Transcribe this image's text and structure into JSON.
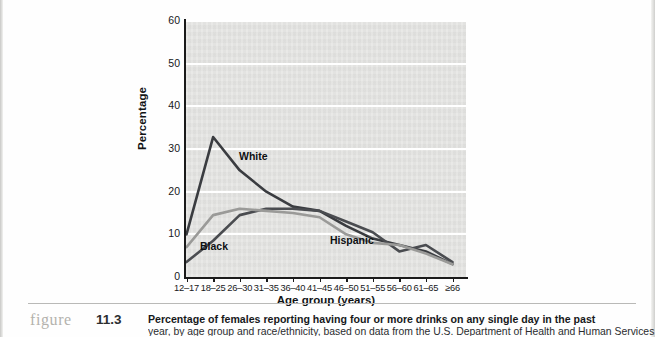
{
  "figure": {
    "label_word": "figure",
    "number": "11.3",
    "caption_line1": "Percentage of females reporting having four or more drinks on any single day in the past",
    "caption_line2": "year, by age group and race/ethnicity, based on data from the U.S. Department of Health and Human Services"
  },
  "chart_data": {
    "type": "line",
    "title": "",
    "xlabel": "Age group (years)",
    "ylabel": "Percentage",
    "categories": [
      "12–17",
      "18–25",
      "26–30",
      "31–35",
      "36–40",
      "41–45",
      "46–50",
      "51–55",
      "56–60",
      "61–65",
      "≥66"
    ],
    "ylim": [
      0,
      60
    ],
    "yticks": [
      0,
      10,
      20,
      30,
      40,
      50,
      60
    ],
    "grid": "horizontal",
    "legend": "inline-labels",
    "series": [
      {
        "name": "White",
        "color": "#3a3c40",
        "values": [
          10,
          32.8,
          25,
          20,
          16.5,
          15.5,
          12,
          9,
          7.5,
          6,
          3
        ]
      },
      {
        "name": "Black",
        "color": "#4a4c50",
        "values": [
          3.5,
          8.5,
          14.5,
          16,
          16,
          15.5,
          13,
          10.5,
          6,
          7.5,
          3.5
        ]
      },
      {
        "name": "Hispanic",
        "color": "#9a9a98",
        "values": [
          7,
          14.5,
          16,
          15.5,
          15,
          14,
          10,
          8,
          7.5,
          5.5,
          3
        ]
      }
    ]
  },
  "colors": {
    "plot_background": "#e3e3e1",
    "gridline": "#ffffff",
    "axis": "#1a1a1a",
    "page_background": "#ffffff"
  }
}
